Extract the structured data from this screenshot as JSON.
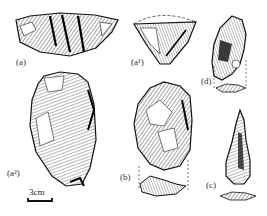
{
  "figure": {
    "labels": {
      "a": "(a)",
      "a1": "(a¹)",
      "a2": "(a²)",
      "b": "(b)",
      "c": "(c)",
      "d": "(d)"
    },
    "scale_bar": "3cm"
  }
}
